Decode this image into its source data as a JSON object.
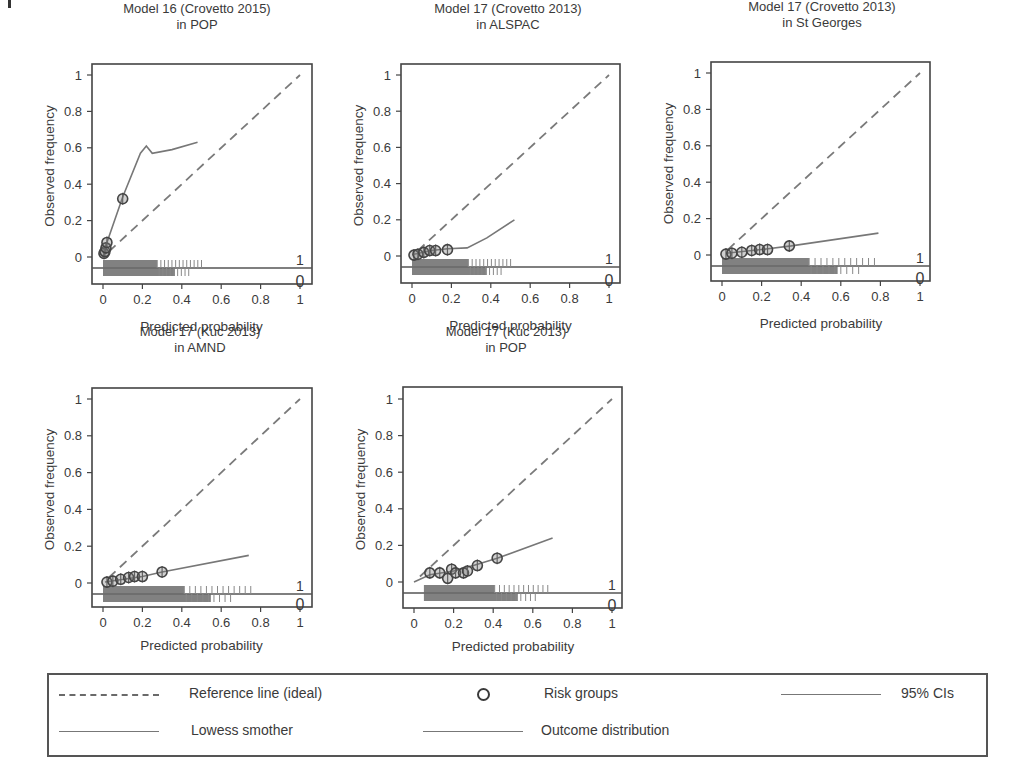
{
  "figure": {
    "panels": [
      {
        "title_line1": "Model 16 (Crovetto 2015)",
        "title_line2": "in POP",
        "xlabel": "Predicted probability",
        "ylabel": "Observed frequency",
        "outcome_labels": [
          "1",
          "0"
        ],
        "xticks": [
          "0",
          "0.2",
          "0.4",
          "0.6",
          "0.8",
          "1"
        ],
        "yticks": [
          "0",
          "0.2",
          "0.4",
          "0.6",
          "0.8",
          "1"
        ]
      },
      {
        "title_line1": "Model 17 (Crovetto 2013)",
        "title_line2": "in ALSPAC",
        "xlabel": "Predicted probability",
        "ylabel": "Observed frequency",
        "outcome_labels": [
          "1",
          "0"
        ],
        "xticks": [
          "0",
          "0.2",
          "0.4",
          "0.6",
          "0.8",
          "1"
        ],
        "yticks": [
          "0",
          "0.2",
          "0.4",
          "0.6",
          "0.8",
          "1"
        ]
      },
      {
        "title_line1": "Model 17 (Crovetto 2013)",
        "title_line2": "in St Georges",
        "xlabel": "Predicted probability",
        "ylabel": "Observed frequency",
        "outcome_labels": [
          "1",
          "0"
        ],
        "xticks": [
          "0",
          "0.2",
          "0.4",
          "0.6",
          "0.8",
          "1"
        ],
        "yticks": [
          "0",
          "0.2",
          "0.4",
          "0.6",
          "0.8",
          "1"
        ]
      },
      {
        "title_line1": "Model 17 (Kuc 2013)",
        "title_line2": "in AMND",
        "xlabel": "Predicted probability",
        "ylabel": "Observed frequency",
        "outcome_labels": [
          "1",
          "0"
        ],
        "xticks": [
          "0",
          "0.2",
          "0.4",
          "0.6",
          "0.8",
          "1"
        ],
        "yticks": [
          "0",
          "0.2",
          "0.4",
          "0.6",
          "0.8",
          "1"
        ]
      },
      {
        "title_line1": "Model 17 (Kuc 2013)",
        "title_line2": "in POP",
        "xlabel": "Predicted probability",
        "ylabel": "Observed frequency",
        "outcome_labels": [
          "1",
          "0"
        ],
        "xticks": [
          "0",
          "0.2",
          "0.4",
          "0.6",
          "0.8",
          "1"
        ],
        "yticks": [
          "0",
          "0.2",
          "0.4",
          "0.6",
          "0.8",
          "1"
        ]
      }
    ],
    "legend": {
      "reference": "Reference line (ideal)",
      "risk_groups": "Risk groups",
      "ci": "95% CIs",
      "lowess": "Lowess smother",
      "outcome_dist": "Outcome distribution"
    }
  },
  "chart_data": [
    {
      "type": "line",
      "title": "Model 16 (Crovetto 2015) in POP",
      "xlabel": "Predicted probability",
      "ylabel": "Observed frequency",
      "xlim": [
        0,
        1
      ],
      "ylim": [
        0,
        1
      ],
      "grid": false,
      "series": [
        {
          "name": "Reference line (ideal)",
          "x": [
            0,
            1
          ],
          "y": [
            0,
            1
          ]
        },
        {
          "name": "Lowess smother",
          "x": [
            0.0,
            0.02,
            0.1,
            0.19,
            0.22,
            0.25,
            0.35,
            0.48
          ],
          "y": [
            0.0,
            0.08,
            0.33,
            0.57,
            0.61,
            0.57,
            0.59,
            0.63
          ]
        },
        {
          "name": "Risk groups",
          "x": [
            0.005,
            0.01,
            0.015,
            0.02,
            0.1
          ],
          "y": [
            0.02,
            0.03,
            0.05,
            0.08,
            0.32
          ]
        }
      ],
      "outcome_distribution_range": [
        0.0,
        0.5
      ]
    },
    {
      "type": "line",
      "title": "Model 17 (Crovetto 2013) in ALSPAC",
      "xlabel": "Predicted probability",
      "ylabel": "Observed frequency",
      "xlim": [
        0,
        1
      ],
      "ylim": [
        0,
        1
      ],
      "grid": false,
      "series": [
        {
          "name": "Reference line (ideal)",
          "x": [
            0,
            1
          ],
          "y": [
            0,
            1
          ]
        },
        {
          "name": "Lowess smother",
          "x": [
            0.01,
            0.1,
            0.18,
            0.28,
            0.38,
            0.52
          ],
          "y": [
            0.01,
            0.03,
            0.04,
            0.045,
            0.1,
            0.2
          ]
        },
        {
          "name": "Risk groups",
          "x": [
            0.01,
            0.03,
            0.06,
            0.09,
            0.12,
            0.18
          ],
          "y": [
            0.005,
            0.01,
            0.02,
            0.03,
            0.03,
            0.035
          ]
        }
      ],
      "outcome_distribution_range": [
        0.0,
        0.52
      ]
    },
    {
      "type": "line",
      "title": "Model 17 (Crovetto 2013) in St Georges",
      "xlabel": "Predicted probability",
      "ylabel": "Observed frequency",
      "xlim": [
        0,
        1
      ],
      "ylim": [
        0,
        1
      ],
      "grid": false,
      "series": [
        {
          "name": "Reference line (ideal)",
          "x": [
            0,
            1
          ],
          "y": [
            0,
            1
          ]
        },
        {
          "name": "Lowess smother",
          "x": [
            0.02,
            0.2,
            0.35,
            0.79
          ],
          "y": [
            0.01,
            0.03,
            0.05,
            0.12
          ]
        },
        {
          "name": "Risk groups",
          "x": [
            0.02,
            0.05,
            0.1,
            0.15,
            0.19,
            0.23,
            0.34
          ],
          "y": [
            0.005,
            0.01,
            0.015,
            0.025,
            0.03,
            0.03,
            0.05
          ]
        }
      ],
      "outcome_distribution_range": [
        0.0,
        0.8
      ]
    },
    {
      "type": "line",
      "title": "Model 17 (Kuc 2013) in AMND",
      "xlabel": "Predicted probability",
      "ylabel": "Observed frequency",
      "xlim": [
        0,
        1
      ],
      "ylim": [
        0,
        1
      ],
      "grid": false,
      "series": [
        {
          "name": "Reference line (ideal)",
          "x": [
            0,
            1
          ],
          "y": [
            0,
            1
          ]
        },
        {
          "name": "Lowess smother",
          "x": [
            0.01,
            0.2,
            0.3,
            0.74
          ],
          "y": [
            0.005,
            0.035,
            0.06,
            0.15
          ]
        },
        {
          "name": "Risk groups",
          "x": [
            0.02,
            0.05,
            0.09,
            0.13,
            0.16,
            0.2,
            0.3
          ],
          "y": [
            0.005,
            0.01,
            0.02,
            0.03,
            0.035,
            0.035,
            0.06
          ]
        }
      ],
      "outcome_distribution_range": [
        0.0,
        0.75
      ]
    },
    {
      "type": "line",
      "title": "Model 17 (Kuc 2013) in POP",
      "xlabel": "Predicted probability",
      "ylabel": "Observed frequency",
      "xlim": [
        0,
        1
      ],
      "ylim": [
        0,
        1
      ],
      "grid": false,
      "series": [
        {
          "name": "Reference line (ideal)",
          "x": [
            0,
            1
          ],
          "y": [
            0,
            1
          ]
        },
        {
          "name": "Lowess smother",
          "x": [
            0.0,
            0.08,
            0.2,
            0.3,
            0.42,
            0.7
          ],
          "y": [
            0.0,
            0.04,
            0.06,
            0.09,
            0.13,
            0.24
          ]
        },
        {
          "name": "Risk groups",
          "x": [
            0.08,
            0.13,
            0.17,
            0.19,
            0.21,
            0.25,
            0.27,
            0.32,
            0.42
          ],
          "y": [
            0.05,
            0.05,
            0.02,
            0.07,
            0.05,
            0.05,
            0.06,
            0.09,
            0.13
          ]
        }
      ],
      "outcome_distribution_range": [
        0.05,
        0.7
      ]
    }
  ]
}
